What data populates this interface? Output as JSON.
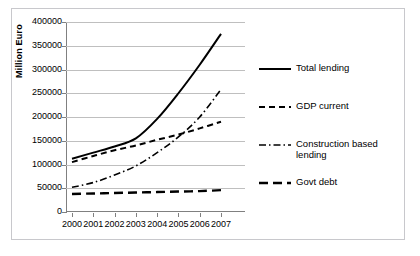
{
  "chart_data": {
    "type": "line",
    "title": "",
    "xlabel": "",
    "ylabel": "Million Euro",
    "x": [
      2000,
      2001,
      2002,
      2003,
      2004,
      2005,
      2006,
      2007
    ],
    "categories": [
      "2000",
      "2001",
      "2002",
      "2003",
      "2004",
      "2005",
      "2006",
      "2007"
    ],
    "ylim": [
      0,
      400000
    ],
    "ytick_step": 50000,
    "yticks": [
      "0",
      "50000",
      "100000",
      "150000",
      "200000",
      "250000",
      "300000",
      "350000",
      "400000"
    ],
    "ytick_values": [
      0,
      50000,
      100000,
      150000,
      200000,
      250000,
      300000,
      350000,
      400000
    ],
    "grid": true,
    "legend_position": "right",
    "series": [
      {
        "name": "Total lending",
        "style": "solid",
        "color": "#000000",
        "values": [
          112000,
          125000,
          138000,
          155000,
          196000,
          250000,
          310000,
          375000
        ]
      },
      {
        "name": "GDP current",
        "style": "dashed",
        "color": "#000000",
        "values": [
          105000,
          118000,
          130000,
          140000,
          152000,
          163000,
          176000,
          190000
        ]
      },
      {
        "name": "Construction based lending",
        "style": "dash-dot",
        "color": "#000000",
        "values": [
          52000,
          62000,
          78000,
          97000,
          125000,
          158000,
          200000,
          258000
        ]
      },
      {
        "name": "Govt debt",
        "style": "long-dash",
        "color": "#000000",
        "values": [
          38000,
          39000,
          40000,
          41000,
          42000,
          43000,
          44000,
          46000
        ]
      }
    ]
  },
  "legend": {
    "items": [
      {
        "label": "Total lending",
        "style": "solid"
      },
      {
        "label": "GDP current",
        "style": "dashed"
      },
      {
        "label": "Construction based lending",
        "style": "dash-dot"
      },
      {
        "label": "Govt debt",
        "style": "long-dash"
      }
    ]
  }
}
